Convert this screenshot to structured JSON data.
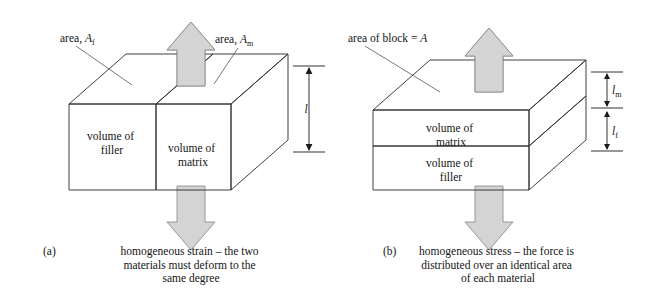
{
  "figure": {
    "panels": [
      {
        "id": "(a)",
        "labels": {
          "area_filler_prefix": "area, ",
          "area_filler_symbol": "A",
          "area_filler_subscript": "f",
          "area_matrix_prefix": "area, ",
          "area_matrix_symbol": "A",
          "area_matrix_subscript": "m",
          "dimension_symbol": "l"
        },
        "blocks": [
          {
            "name": "filler",
            "line1": "volume of",
            "line2": "filler",
            "fill": "#e8e8e8"
          },
          {
            "name": "matrix",
            "line1": "volume of",
            "line2": "matrix",
            "fill": "#ffffff"
          }
        ],
        "caption": {
          "line1": "homogeneous strain – the two",
          "line2": "materials must deform to the",
          "line3": "same degree"
        },
        "arrows": {
          "top": "up-block-arrow",
          "bottom": "down-block-arrow"
        }
      },
      {
        "id": "(b)",
        "labels": {
          "area_block_prefix": "area of block = ",
          "area_block_symbol": "A",
          "dim_matrix_symbol": "l",
          "dim_matrix_subscript": "m",
          "dim_filler_symbol": "l",
          "dim_filler_subscript": "f"
        },
        "blocks": [
          {
            "name": "matrix",
            "line1": "volume of",
            "line2": "matrix",
            "fill": "#ffffff"
          },
          {
            "name": "filler",
            "line1": "volume of",
            "line2": "filler",
            "fill": "#e8e8e8"
          }
        ],
        "caption": {
          "line1": "homogeneous stress – the force is",
          "line2": "distributed over an identical area",
          "line3": "of each material"
        },
        "arrows": {
          "top": "up-block-arrow",
          "bottom": "down-block-arrow"
        }
      }
    ],
    "colors": {
      "shaded_face": "#e8e8e8",
      "plain_face": "#ffffff",
      "top_shaded": "#ebebeb",
      "side_shaded": "#dedede",
      "arrow_fill": "#d4d4d4",
      "outline": "#2b2b2b",
      "background": "#ffffff"
    }
  }
}
